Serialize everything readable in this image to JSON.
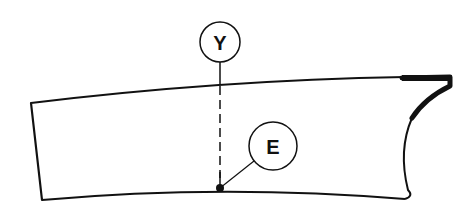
{
  "diagram": {
    "labels": {
      "y": "Y",
      "e": "E"
    },
    "colors": {
      "stroke": "#111111",
      "background": "#ffffff"
    }
  }
}
